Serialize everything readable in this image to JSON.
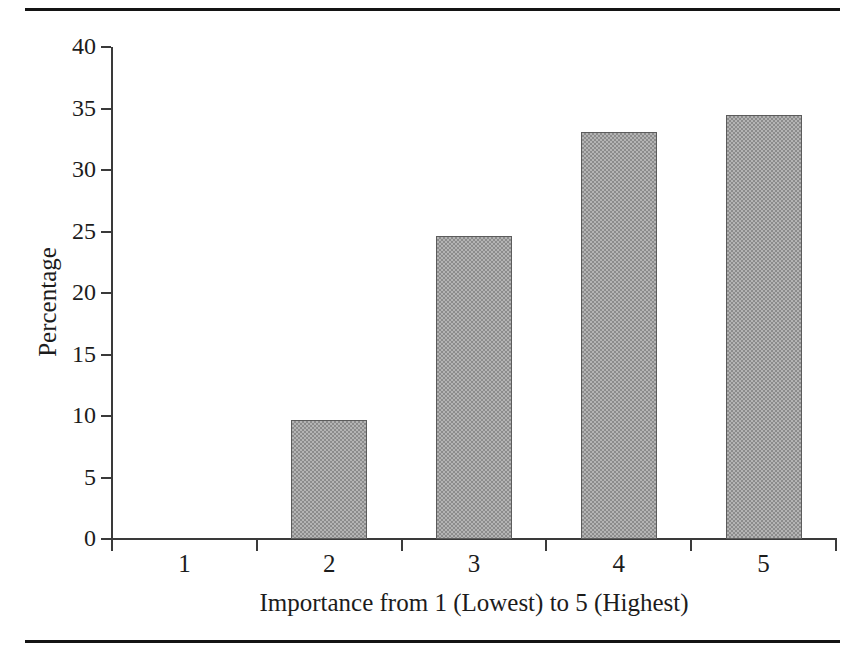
{
  "figure": {
    "name": "bar-chart-importance-percentage",
    "rules": {
      "top_rule": "horizontal-rule",
      "bottom_rule": "horizontal-rule"
    }
  },
  "chart_data": {
    "type": "bar",
    "title": "",
    "subtitle": "",
    "xlabel": "Importance from 1 (Lowest) to 5 (Highest)",
    "ylabel": "Percentage",
    "categories": [
      "1",
      "2",
      "3",
      "4",
      "5"
    ],
    "values": [
      0,
      9.7,
      24.6,
      33.1,
      34.5
    ],
    "series": [
      {
        "name": "Percentage",
        "values": [
          0,
          9.7,
          24.6,
          33.1,
          34.5
        ]
      }
    ],
    "ylim": [
      0,
      40
    ],
    "xlim": [
      0,
      5
    ],
    "ytick_labels": [
      "0",
      "5",
      "10",
      "15",
      "20",
      "25",
      "30",
      "35",
      "40"
    ],
    "ytick_values": [
      0,
      5,
      10,
      15,
      20,
      25,
      30,
      35,
      40
    ],
    "xtick_labels": [
      "1",
      "2",
      "3",
      "4",
      "5"
    ],
    "grid": false,
    "legend": "none",
    "bar_color": "#9a9a9a",
    "bar_edge_color": "#5c5c5c",
    "axis_color": "#3a3a3a",
    "text_color": "#1c1c1c",
    "background_color": "#ffffff"
  }
}
